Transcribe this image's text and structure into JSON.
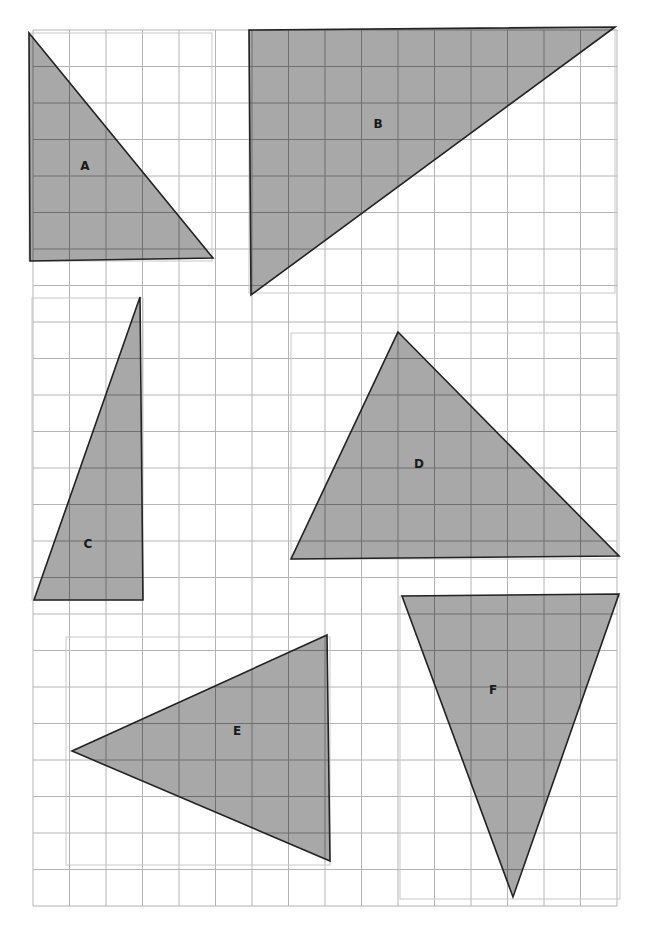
{
  "grid": {
    "x0": 33,
    "y0": 30,
    "cell": 36.5,
    "cols": 16,
    "rows": 24,
    "line_color": "#b4b4b4",
    "region_outline_color": "#c8c8c8"
  },
  "colors": {
    "fill": "#a8a8a8",
    "stroke": "#222222",
    "inner_grid": "#6f6f6f"
  },
  "regions": [
    {
      "name": "region-a",
      "x": 29,
      "y": 33,
      "w": 183,
      "h": 228
    },
    {
      "name": "region-b",
      "x": 249,
      "y": 30,
      "w": 366,
      "h": 263
    },
    {
      "name": "region-c",
      "x": 32,
      "y": 298,
      "w": 111,
      "h": 302
    },
    {
      "name": "region-d",
      "x": 291,
      "y": 333,
      "w": 328,
      "h": 226
    },
    {
      "name": "region-e",
      "x": 66,
      "y": 637,
      "w": 264,
      "h": 228
    },
    {
      "name": "region-f",
      "x": 400,
      "y": 596,
      "w": 220,
      "h": 303
    }
  ],
  "triangles": [
    {
      "id": "A",
      "label": "A",
      "points": [
        [
          29,
          33
        ],
        [
          213,
          258
        ],
        [
          30,
          261
        ]
      ],
      "label_pos": [
        85,
        170
      ]
    },
    {
      "id": "B",
      "label": "B",
      "points": [
        [
          249,
          30
        ],
        [
          615,
          27
        ],
        [
          251,
          295
        ]
      ],
      "label_pos": [
        378,
        128
      ]
    },
    {
      "id": "C",
      "label": "C",
      "points": [
        [
          140,
          297
        ],
        [
          143,
          600
        ],
        [
          34,
          600
        ]
      ],
      "label_pos": [
        88,
        548
      ]
    },
    {
      "id": "D",
      "label": "D",
      "points": [
        [
          398,
          332
        ],
        [
          619,
          556
        ],
        [
          291,
          559
        ]
      ],
      "label_pos": [
        419,
        468
      ]
    },
    {
      "id": "E",
      "label": "E",
      "points": [
        [
          72,
          751
        ],
        [
          327,
          635
        ],
        [
          330,
          861
        ]
      ],
      "label_pos": [
        237,
        735
      ]
    },
    {
      "id": "F",
      "label": "F",
      "points": [
        [
          402,
          596
        ],
        [
          619,
          594
        ],
        [
          513,
          897
        ]
      ],
      "label_pos": [
        493,
        694
      ]
    }
  ]
}
